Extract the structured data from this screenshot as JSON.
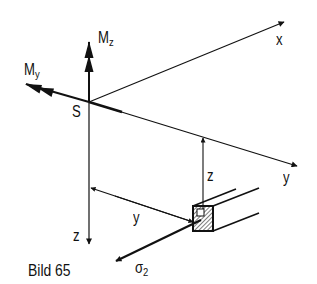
{
  "figure": {
    "caption": "Bild 65",
    "colors": {
      "ink": "#111111",
      "background": "#ffffff"
    }
  },
  "labels": {
    "x_axis": "x",
    "y_axis": "y",
    "z_axis": "z",
    "origin": "S",
    "moment_y_base": "M",
    "moment_y_sub": "y",
    "moment_z_base": "M",
    "moment_z_sub": "z",
    "dim_y": "y",
    "dim_z": "z",
    "stress_base": "σ",
    "stress_sub": "2"
  }
}
